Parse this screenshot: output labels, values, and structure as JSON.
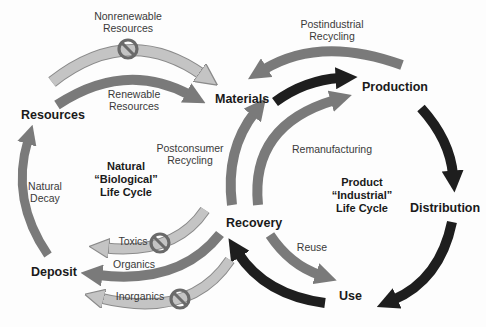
{
  "diagram": {
    "type": "life-cycle-flow",
    "nodes": {
      "resources": "Resources",
      "materials": "Materials",
      "production": "Production",
      "distribution": "Distribution",
      "use": "Use",
      "recovery": "Recovery",
      "deposit": "Deposit"
    },
    "cycles": {
      "natural": "Natural\n“Biological”\nLife Cycle",
      "industrial": "Product\n“Industrial”\nLife Cycle"
    },
    "flows": {
      "nonrenewable": "Nonrenewable\nResources",
      "renewable": "Renewable\nResources",
      "postindustrial": "Postindustrial\nRecycling",
      "postconsumer": "Postconsumer\nRecycling",
      "remanufacturing": "Remanufacturing",
      "reuse": "Reuse",
      "natural_decay": "Natural\nDecay",
      "toxics": "Toxics",
      "organics": "Organics",
      "inorganics": "Inorganics"
    },
    "edges": [
      {
        "from": "Resources",
        "to": "Materials",
        "label": "Nonrenewable Resources",
        "prohibited": true,
        "shade": "light"
      },
      {
        "from": "Resources",
        "to": "Materials",
        "label": "Renewable Resources",
        "prohibited": false,
        "shade": "medium"
      },
      {
        "from": "Materials",
        "to": "Production",
        "label": "",
        "prohibited": false,
        "shade": "dark"
      },
      {
        "from": "Production",
        "to": "Materials",
        "label": "Postindustrial Recycling",
        "prohibited": false,
        "shade": "medium"
      },
      {
        "from": "Production",
        "to": "Distribution",
        "label": "",
        "prohibited": false,
        "shade": "dark"
      },
      {
        "from": "Distribution",
        "to": "Use",
        "label": "",
        "prohibited": false,
        "shade": "dark"
      },
      {
        "from": "Use",
        "to": "Recovery",
        "label": "",
        "prohibited": false,
        "shade": "dark"
      },
      {
        "from": "Recovery",
        "to": "Use",
        "label": "Reuse",
        "prohibited": false,
        "shade": "medium"
      },
      {
        "from": "Recovery",
        "to": "Materials",
        "label": "Postconsumer Recycling",
        "prohibited": false,
        "shade": "medium"
      },
      {
        "from": "Recovery",
        "to": "Production",
        "label": "Remanufacturing",
        "prohibited": false,
        "shade": "medium"
      },
      {
        "from": "Recovery",
        "to": "Deposit",
        "label": "Toxics",
        "prohibited": true,
        "shade": "light"
      },
      {
        "from": "Recovery",
        "to": "Deposit",
        "label": "Organics",
        "prohibited": false,
        "shade": "medium"
      },
      {
        "from": "Recovery",
        "to": "Deposit",
        "label": "Inorganics",
        "prohibited": true,
        "shade": "light"
      },
      {
        "from": "Deposit",
        "to": "Resources",
        "label": "Natural Decay",
        "prohibited": false,
        "shade": "medium"
      }
    ],
    "colors": {
      "dark": "#1e1e1e",
      "medium": "#7a7a7a",
      "light": "#bdbdbd",
      "prohibit": "#6a6a6a"
    }
  }
}
